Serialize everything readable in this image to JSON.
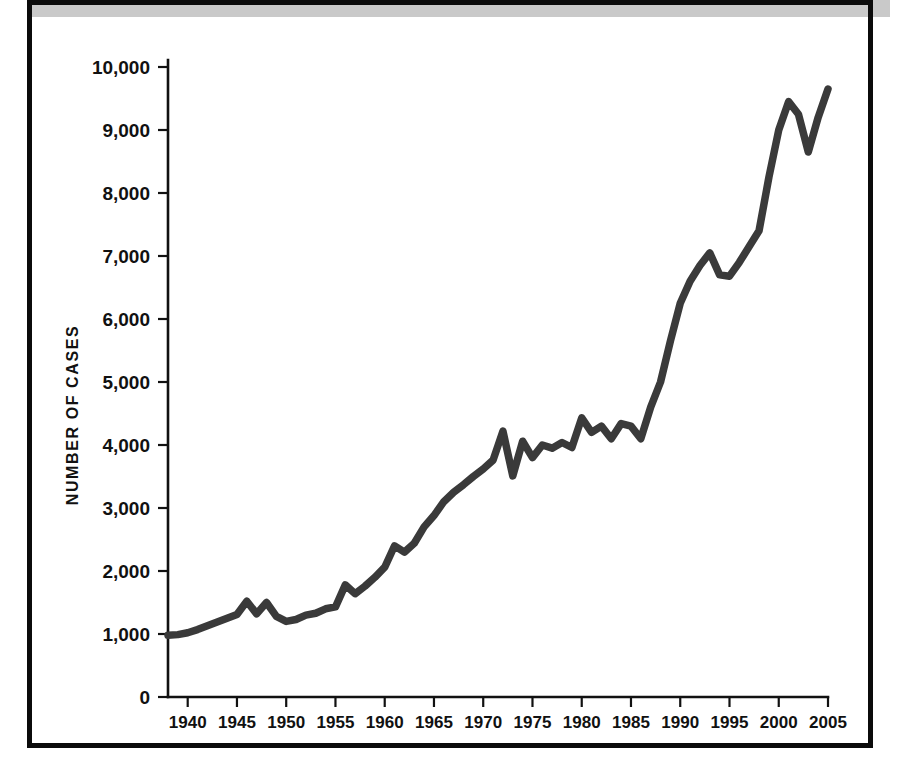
{
  "figure": {
    "background_color": "#ffffff",
    "frame_color": "#0b0b0b",
    "top_band_color": "#c9c9c9",
    "line_color": "#3a3a3a"
  },
  "axes": {
    "y_title": "NUMBER OF CASES",
    "y_tick_labels": [
      "10,000",
      "9,000",
      "8,000",
      "7,000",
      "6,000",
      "5,000",
      "4,000",
      "3,000",
      "2,000",
      "1,000",
      "0"
    ],
    "x_tick_labels": [
      "1940",
      "1945",
      "1950",
      "1955",
      "1960",
      "1965",
      "1970",
      "1975",
      "1980",
      "1985",
      "1990",
      "1995",
      "2000",
      "2005"
    ]
  },
  "chart_data": {
    "type": "line",
    "title": "",
    "subtitle": "",
    "xlabel": "",
    "ylabel": "NUMBER OF CASES",
    "xlim": [
      1938,
      2005
    ],
    "ylim": [
      0,
      10000
    ],
    "ytick_values": [
      0,
      1000,
      2000,
      3000,
      4000,
      5000,
      6000,
      7000,
      8000,
      9000,
      10000
    ],
    "xtick_values": [
      1940,
      1945,
      1950,
      1955,
      1960,
      1965,
      1970,
      1975,
      1980,
      1985,
      1990,
      1995,
      2000,
      2005
    ],
    "grid": false,
    "legend": false,
    "legend_position": "none",
    "series": [
      {
        "name": "Number of cases",
        "x": [
          1938,
          1939,
          1940,
          1941,
          1942,
          1943,
          1944,
          1945,
          1946,
          1947,
          1948,
          1949,
          1950,
          1951,
          1952,
          1953,
          1954,
          1955,
          1956,
          1957,
          1958,
          1959,
          1960,
          1961,
          1962,
          1963,
          1964,
          1965,
          1966,
          1967,
          1968,
          1969,
          1970,
          1971,
          1972,
          1973,
          1974,
          1975,
          1976,
          1977,
          1978,
          1979,
          1980,
          1981,
          1982,
          1983,
          1984,
          1985,
          1986,
          1987,
          1988,
          1989,
          1990,
          1991,
          1992,
          1993,
          1994,
          1995,
          1996,
          1997,
          1998,
          1999,
          2000,
          2001,
          2002,
          2003,
          2004,
          2005
        ],
        "values": [
          980,
          990,
          1020,
          1070,
          1130,
          1190,
          1250,
          1310,
          1520,
          1320,
          1500,
          1280,
          1200,
          1230,
          1300,
          1330,
          1400,
          1430,
          1780,
          1640,
          1760,
          1900,
          2060,
          2400,
          2300,
          2440,
          2700,
          2880,
          3100,
          3250,
          3370,
          3500,
          3620,
          3760,
          4220,
          3510,
          4060,
          3800,
          4000,
          3950,
          4040,
          3960,
          4430,
          4200,
          4300,
          4100,
          4340,
          4300,
          4100,
          4600,
          5000,
          5650,
          6250,
          6600,
          6850,
          7050,
          6700,
          6680,
          6900,
          7150,
          7400,
          8250,
          9000,
          9450,
          9250,
          8650,
          9200,
          9650
        ]
      }
    ]
  }
}
